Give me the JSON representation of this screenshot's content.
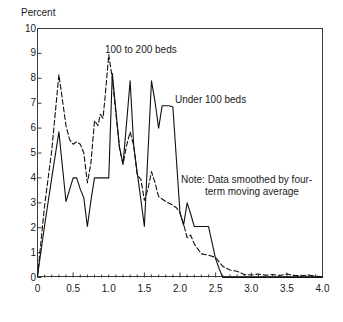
{
  "chart_data": {
    "type": "line",
    "title": "",
    "xlabel": "Hernia equivalent per operation",
    "ylabel": "Percent",
    "xlim": [
      0,
      4.0
    ],
    "ylim": [
      0,
      10
    ],
    "grid": false,
    "legend_position": "inline-annotations",
    "xticks": [
      "0",
      "0.5",
      "1.0",
      "1.5",
      "2.0",
      "2.5",
      "3.0",
      "3.5",
      "4.0"
    ],
    "xtick_values": [
      0,
      0.5,
      1.0,
      1.5,
      2.0,
      2.5,
      3.0,
      3.5,
      4.0
    ],
    "xminor_step": 0.1,
    "yticks": [
      "0",
      "1",
      "2",
      "3",
      "4",
      "5",
      "6",
      "7",
      "8",
      "9",
      "10"
    ],
    "ytick_values": [
      0,
      1,
      2,
      3,
      4,
      5,
      6,
      7,
      8,
      9,
      10
    ],
    "annotations": [
      {
        "name": "series-label-100-to-200-beds",
        "text": "100 to 200 beds"
      },
      {
        "name": "series-label-under-100-beds",
        "text": "Under 100 beds"
      },
      {
        "name": "chart-note-line-1",
        "text": "Note: Data smoothed by four-"
      },
      {
        "name": "chart-note-line-2",
        "text": "term moving average"
      }
    ],
    "series": [
      {
        "name": "Under 100 beds",
        "style": "solid",
        "color": "#111111",
        "x": [
          0.0,
          0.1,
          0.2,
          0.3,
          0.4,
          0.5,
          0.55,
          0.6,
          0.65,
          0.7,
          0.75,
          0.8,
          0.85,
          0.95,
          1.0,
          1.05,
          1.1,
          1.15,
          1.2,
          1.25,
          1.3,
          1.35,
          1.4,
          1.45,
          1.5,
          1.55,
          1.6,
          1.65,
          1.7,
          1.75,
          1.85,
          1.9,
          2.0,
          2.05,
          2.1,
          2.15,
          2.2,
          2.25,
          2.35,
          2.4,
          2.5,
          2.55,
          2.6,
          4.0
        ],
        "y": [
          0.05,
          2.1,
          4.0,
          5.85,
          3.05,
          4.0,
          4.0,
          3.55,
          3.2,
          2.05,
          3.1,
          4.0,
          4.0,
          4.0,
          4.0,
          8.2,
          6.7,
          5.25,
          4.55,
          6.2,
          7.9,
          5.3,
          4.2,
          3.15,
          2.05,
          5.0,
          7.9,
          7.05,
          6.0,
          6.9,
          6.9,
          6.85,
          2.6,
          2.1,
          3.0,
          2.55,
          2.05,
          2.05,
          2.05,
          2.05,
          0.75,
          0.35,
          0.0,
          0.0
        ]
      },
      {
        "name": "100 to 200 beds",
        "style": "dashed",
        "color": "#111111",
        "x": [
          0.0,
          0.1,
          0.2,
          0.3,
          0.4,
          0.45,
          0.5,
          0.55,
          0.6,
          0.65,
          0.7,
          0.75,
          0.8,
          0.85,
          0.88,
          0.92,
          0.95,
          1.0,
          1.05,
          1.1,
          1.15,
          1.2,
          1.25,
          1.3,
          1.35,
          1.4,
          1.45,
          1.5,
          1.55,
          1.6,
          1.65,
          1.7,
          1.75,
          1.8,
          1.9,
          1.95,
          2.0,
          2.05,
          2.1,
          2.15,
          2.2,
          2.25,
          2.3,
          2.4,
          2.5,
          2.6,
          2.7,
          2.8,
          2.9,
          3.0,
          3.1,
          3.2,
          3.3,
          3.4,
          3.5,
          3.6,
          3.7,
          3.8,
          3.9,
          4.0
        ],
        "y": [
          0.05,
          2.9,
          5.1,
          8.15,
          6.1,
          5.55,
          5.35,
          5.45,
          5.35,
          5.0,
          3.8,
          4.6,
          6.3,
          6.1,
          6.55,
          6.4,
          7.3,
          8.95,
          8.0,
          6.6,
          5.2,
          4.55,
          5.3,
          5.85,
          5.3,
          4.1,
          3.95,
          3.1,
          3.55,
          4.25,
          3.8,
          3.25,
          3.15,
          3.05,
          2.9,
          2.8,
          2.6,
          2.15,
          1.6,
          1.7,
          1.35,
          1.15,
          0.95,
          0.9,
          0.8,
          0.45,
          0.3,
          0.25,
          0.12,
          0.1,
          0.14,
          0.09,
          0.12,
          0.08,
          0.14,
          0.08,
          0.07,
          0.1,
          0.05,
          0.04
        ]
      }
    ]
  }
}
